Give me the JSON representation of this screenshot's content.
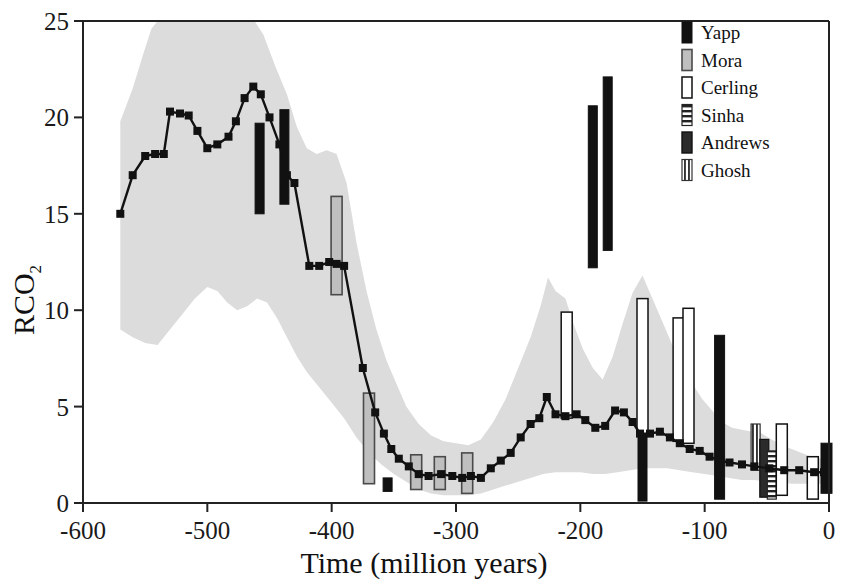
{
  "chart_data": {
    "type": "line",
    "title": "",
    "xlabel": "Time (million years)",
    "ylabel": "RCO2",
    "ylabel_base": "RCO",
    "ylabel_sub": "2",
    "xlim": [
      -600,
      0
    ],
    "ylim": [
      0,
      25
    ],
    "xticks": [
      -600,
      -500,
      -400,
      -300,
      -200,
      -100,
      0
    ],
    "xtick_labels": [
      "-600",
      "-500",
      "-400",
      "-300",
      "-200",
      "-100",
      "0"
    ],
    "yticks": [
      0,
      5,
      10,
      15,
      20,
      25
    ],
    "ytick_labels": [
      "0",
      "5",
      "10",
      "15",
      "20",
      "25"
    ],
    "grid": false,
    "legend_position": "top-right",
    "series": [
      {
        "name": "GEOCARB model curve",
        "type": "line-markers",
        "marker": "square",
        "color": "#111111",
        "points": [
          [
            -570,
            15.0
          ],
          [
            -560,
            17.0
          ],
          [
            -550,
            18.0
          ],
          [
            -542,
            18.1
          ],
          [
            -535,
            18.1
          ],
          [
            -530,
            20.3
          ],
          [
            -522,
            20.2
          ],
          [
            -515,
            20.1
          ],
          [
            -508,
            19.3
          ],
          [
            -500,
            18.4
          ],
          [
            -492,
            18.6
          ],
          [
            -483,
            19.0
          ],
          [
            -477,
            19.8
          ],
          [
            -470,
            21.0
          ],
          [
            -463,
            21.6
          ],
          [
            -457,
            21.2
          ],
          [
            -450,
            20.0
          ],
          [
            -442,
            18.6
          ],
          [
            -436,
            17.0
          ],
          [
            -430,
            16.6
          ],
          [
            -418,
            12.3
          ],
          [
            -410,
            12.3
          ],
          [
            -402,
            12.5
          ],
          [
            -396,
            12.4
          ],
          [
            -390,
            12.3
          ],
          [
            -375,
            7.0
          ],
          [
            -365,
            4.7
          ],
          [
            -358,
            3.6
          ],
          [
            -352,
            2.8
          ],
          [
            -346,
            2.3
          ],
          [
            -338,
            1.9
          ],
          [
            -330,
            1.5
          ],
          [
            -322,
            1.4
          ],
          [
            -312,
            1.5
          ],
          [
            -303,
            1.4
          ],
          [
            -295,
            1.3
          ],
          [
            -288,
            1.4
          ],
          [
            -280,
            1.3
          ],
          [
            -272,
            1.8
          ],
          [
            -264,
            2.2
          ],
          [
            -256,
            2.6
          ],
          [
            -248,
            3.4
          ],
          [
            -240,
            4.1
          ],
          [
            -233,
            4.4
          ],
          [
            -227,
            5.5
          ],
          [
            -220,
            4.6
          ],
          [
            -212,
            4.5
          ],
          [
            -203,
            4.6
          ],
          [
            -196,
            4.3
          ],
          [
            -188,
            3.9
          ],
          [
            -180,
            4.0
          ],
          [
            -172,
            4.8
          ],
          [
            -165,
            4.7
          ],
          [
            -158,
            4.2
          ],
          [
            -152,
            3.6
          ],
          [
            -144,
            3.6
          ],
          [
            -136,
            3.7
          ],
          [
            -128,
            3.4
          ],
          [
            -120,
            3.1
          ],
          [
            -112,
            2.8
          ],
          [
            -104,
            2.7
          ],
          [
            -96,
            2.4
          ],
          [
            -88,
            2.2
          ],
          [
            -80,
            2.1
          ],
          [
            -70,
            2.0
          ],
          [
            -60,
            1.9
          ],
          [
            -48,
            1.8
          ],
          [
            -36,
            1.7
          ],
          [
            -24,
            1.7
          ],
          [
            -12,
            1.6
          ],
          [
            -4,
            1.6
          ]
        ]
      }
    ],
    "uncertainty_band": {
      "name": "model uncertainty envelope",
      "color": "#dcdcdc",
      "upper": [
        [
          -570,
          19.8
        ],
        [
          -560,
          21.5
        ],
        [
          -552,
          23.2
        ],
        [
          -545,
          24.6
        ],
        [
          -540,
          25.0
        ],
        [
          -500,
          25.0
        ],
        [
          -470,
          25.0
        ],
        [
          -462,
          25.0
        ],
        [
          -455,
          24.3
        ],
        [
          -445,
          22.6
        ],
        [
          -436,
          21.2
        ],
        [
          -428,
          19.5
        ],
        [
          -420,
          18.4
        ],
        [
          -412,
          18.1
        ],
        [
          -404,
          18.3
        ],
        [
          -396,
          18.1
        ],
        [
          -388,
          16.6
        ],
        [
          -380,
          13.5
        ],
        [
          -372,
          11.0
        ],
        [
          -364,
          9.0
        ],
        [
          -356,
          7.4
        ],
        [
          -348,
          6.2
        ],
        [
          -340,
          5.0
        ],
        [
          -330,
          4.1
        ],
        [
          -320,
          3.5
        ],
        [
          -310,
          3.2
        ],
        [
          -300,
          3.1
        ],
        [
          -290,
          3.0
        ],
        [
          -280,
          3.3
        ],
        [
          -270,
          4.2
        ],
        [
          -260,
          5.4
        ],
        [
          -250,
          7.0
        ],
        [
          -240,
          8.6
        ],
        [
          -232,
          10.2
        ],
        [
          -226,
          11.7
        ],
        [
          -220,
          11.0
        ],
        [
          -212,
          10.6
        ],
        [
          -205,
          9.2
        ],
        [
          -198,
          8.0
        ],
        [
          -190,
          7.0
        ],
        [
          -182,
          6.4
        ],
        [
          -174,
          7.6
        ],
        [
          -166,
          9.3
        ],
        [
          -158,
          10.9
        ],
        [
          -150,
          11.8
        ],
        [
          -142,
          10.6
        ],
        [
          -134,
          9.4
        ],
        [
          -126,
          8.2
        ],
        [
          -118,
          7.2
        ],
        [
          -110,
          6.2
        ],
        [
          -102,
          5.4
        ],
        [
          -94,
          4.8
        ],
        [
          -86,
          4.2
        ],
        [
          -78,
          3.9
        ],
        [
          -70,
          3.8
        ],
        [
          -62,
          3.7
        ],
        [
          -54,
          3.6
        ],
        [
          -46,
          3.3
        ],
        [
          -38,
          3.0
        ],
        [
          -30,
          2.8
        ],
        [
          -22,
          2.6
        ],
        [
          -14,
          2.4
        ],
        [
          -6,
          2.3
        ],
        [
          0,
          2.2
        ]
      ],
      "lower": [
        [
          -570,
          9.0
        ],
        [
          -560,
          8.6
        ],
        [
          -550,
          8.3
        ],
        [
          -540,
          8.2
        ],
        [
          -530,
          9.0
        ],
        [
          -520,
          9.8
        ],
        [
          -510,
          10.6
        ],
        [
          -500,
          11.2
        ],
        [
          -492,
          11.0
        ],
        [
          -484,
          10.4
        ],
        [
          -476,
          10.0
        ],
        [
          -468,
          10.2
        ],
        [
          -460,
          10.6
        ],
        [
          -452,
          10.4
        ],
        [
          -444,
          9.6
        ],
        [
          -436,
          8.6
        ],
        [
          -428,
          7.6
        ],
        [
          -420,
          6.8
        ],
        [
          -410,
          6.0
        ],
        [
          -400,
          5.2
        ],
        [
          -390,
          4.4
        ],
        [
          -380,
          3.4
        ],
        [
          -370,
          2.6
        ],
        [
          -360,
          2.0
        ],
        [
          -350,
          1.5
        ],
        [
          -340,
          1.1
        ],
        [
          -330,
          0.7
        ],
        [
          -320,
          0.5
        ],
        [
          -310,
          0.4
        ],
        [
          -300,
          0.4
        ],
        [
          -290,
          0.4
        ],
        [
          -280,
          0.5
        ],
        [
          -270,
          0.7
        ],
        [
          -260,
          0.9
        ],
        [
          -250,
          1.1
        ],
        [
          -240,
          1.3
        ],
        [
          -230,
          1.5
        ],
        [
          -220,
          1.6
        ],
        [
          -210,
          1.6
        ],
        [
          -200,
          1.6
        ],
        [
          -190,
          1.5
        ],
        [
          -180,
          1.5
        ],
        [
          -170,
          1.6
        ],
        [
          -160,
          1.7
        ],
        [
          -150,
          1.8
        ],
        [
          -140,
          1.8
        ],
        [
          -130,
          1.8
        ],
        [
          -120,
          1.7
        ],
        [
          -110,
          1.6
        ],
        [
          -100,
          1.5
        ],
        [
          -90,
          1.4
        ],
        [
          -80,
          1.3
        ],
        [
          -70,
          1.2
        ],
        [
          -60,
          1.2
        ],
        [
          -50,
          1.1
        ],
        [
          -40,
          1.1
        ],
        [
          -30,
          1.0
        ],
        [
          -20,
          1.0
        ],
        [
          -10,
          1.0
        ],
        [
          0,
          1.0
        ]
      ]
    },
    "proxy_bars": [
      {
        "source": "Yapp",
        "x": -458,
        "low": 15.0,
        "high": 19.7,
        "width": 9
      },
      {
        "source": "Yapp",
        "x": -438,
        "low": 15.5,
        "high": 20.4,
        "width": 9
      },
      {
        "source": "Mora",
        "x": -396,
        "low": 10.8,
        "high": 15.9,
        "width": 11
      },
      {
        "source": "Mora",
        "x": -370,
        "low": 1.0,
        "high": 5.7,
        "width": 11
      },
      {
        "source": "Yapp",
        "x": -355,
        "low": 0.6,
        "high": 1.3,
        "width": 9
      },
      {
        "source": "Mora",
        "x": -332,
        "low": 0.7,
        "high": 2.5,
        "width": 11
      },
      {
        "source": "Mora",
        "x": -313,
        "low": 0.7,
        "high": 2.4,
        "width": 11
      },
      {
        "source": "Mora",
        "x": -291,
        "low": 0.5,
        "high": 2.6,
        "width": 11
      },
      {
        "source": "Cerling",
        "x": -211,
        "low": 4.4,
        "high": 9.9,
        "width": 11
      },
      {
        "source": "Yapp",
        "x": -190,
        "low": 12.2,
        "high": 20.6,
        "width": 9
      },
      {
        "source": "Yapp",
        "x": -178,
        "low": 13.1,
        "high": 22.1,
        "width": 9
      },
      {
        "source": "Cerling",
        "x": -150,
        "low": 3.5,
        "high": 10.6,
        "width": 11
      },
      {
        "source": "Yapp",
        "x": -150,
        "low": 0.1,
        "high": 3.6,
        "width": 9
      },
      {
        "source": "Cerling",
        "x": -121,
        "low": 3.2,
        "high": 9.6,
        "width": 11
      },
      {
        "source": "Cerling",
        "x": -113,
        "low": 3.1,
        "high": 10.1,
        "width": 11
      },
      {
        "source": "Yapp",
        "x": -88,
        "low": 0.2,
        "high": 8.7,
        "width": 10
      },
      {
        "source": "Ghosh",
        "x": -59,
        "low": 1.7,
        "high": 4.1,
        "width": 9
      },
      {
        "source": "Andrews",
        "x": -52,
        "low": 0.3,
        "high": 3.3,
        "width": 9
      },
      {
        "source": "Sinha",
        "x": -46,
        "low": 0.2,
        "high": 2.7,
        "width": 9
      },
      {
        "source": "Cerling",
        "x": -38,
        "low": 0.4,
        "high": 4.1,
        "width": 11
      },
      {
        "source": "Cerling",
        "x": -13,
        "low": 0.2,
        "high": 2.4,
        "width": 11
      },
      {
        "source": "Yapp",
        "x": -2,
        "low": 0.5,
        "high": 3.1,
        "width": 11
      }
    ]
  },
  "legend": {
    "items": [
      {
        "label": "Yapp",
        "style": "solid-black"
      },
      {
        "label": "Mora",
        "style": "gray-fill"
      },
      {
        "label": "Cerling",
        "style": "open-white"
      },
      {
        "label": "Sinha",
        "style": "horizontal-stripes"
      },
      {
        "label": "Andrews",
        "style": "dark-solid"
      },
      {
        "label": "Ghosh",
        "style": "vertical-stripes"
      }
    ]
  },
  "colors": {
    "axis": "#222222",
    "curve": "#111111",
    "band": "#dcdcdc",
    "yapp": "#111111",
    "mora": "#bfbfbf",
    "mora_edge": "#4a4a4a",
    "cerling": "#ffffff",
    "cerling_edge": "#111111",
    "sinha_stripe": "#222222",
    "andrews": "#2b2b2b",
    "ghosh_stripe": "#333333",
    "background": "#ffffff"
  }
}
